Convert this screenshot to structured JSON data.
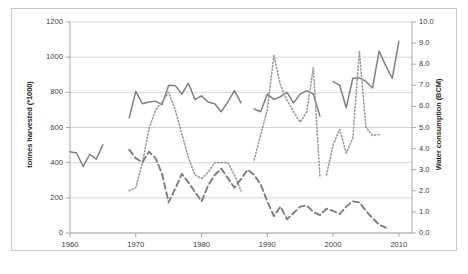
{
  "chart_data": {
    "type": "line",
    "title": "",
    "xlabel": "",
    "ylabel": "tonnes harvested (*1000)",
    "y2label": "Water consumption (BCM)",
    "xlim": [
      1960,
      2012
    ],
    "ylim": [
      0,
      1200
    ],
    "y2lim": [
      0.0,
      10.0
    ],
    "grid": true,
    "legend": "none",
    "x_ticks": [
      "1960",
      "1970",
      "1980",
      "1990",
      "2000",
      "2010"
    ],
    "x_tick_values": [
      1960,
      1970,
      1980,
      1990,
      2000,
      2010
    ],
    "y_ticks": [
      "0",
      "200",
      "400",
      "600",
      "800",
      "1000",
      "1200"
    ],
    "y_tick_values": [
      0,
      200,
      400,
      600,
      800,
      1000,
      1200
    ],
    "y2_ticks": [
      "0.0",
      "1.0",
      "2.0",
      "3.0",
      "4.0",
      "5.0",
      "6.0",
      "7.0",
      "8.0",
      "9.0",
      "10.0"
    ],
    "y2_tick_values": [
      0.0,
      1.0,
      2.0,
      3.0,
      4.0,
      5.0,
      6.0,
      7.0,
      8.0,
      9.0,
      10.0
    ],
    "series": [
      {
        "name": "tonnes harvested",
        "axis": "left",
        "style": "solid",
        "color": "#808080",
        "segments": [
          {
            "x": [
              1960,
              1961,
              1962,
              1963,
              1964,
              1965
            ],
            "y": [
              462,
              455,
              378,
              448,
              420,
              502
            ]
          },
          {
            "x": [
              1969,
              1970,
              1971,
              1972,
              1973,
              1974,
              1975,
              1976,
              1977,
              1978,
              1979,
              1980,
              1981,
              1982,
              1983,
              1984,
              1985,
              1986
            ],
            "y": [
              655,
              805,
              735,
              745,
              750,
              730,
              840,
              838,
              790,
              852,
              760,
              780,
              745,
              735,
              690,
              745,
              810,
              740
            ]
          },
          {
            "x": [
              1988,
              1989,
              1990,
              1991,
              1992,
              1993,
              1994,
              1995,
              1996,
              1997,
              1998
            ],
            "y": [
              705,
              690,
              790,
              760,
              775,
              800,
              740,
              790,
              810,
              790,
              665
            ]
          },
          {
            "x": [
              2000,
              2001,
              2002,
              2003,
              2004,
              2005,
              2006,
              2007,
              2008,
              2009,
              2010
            ],
            "y": [
              862,
              840,
              712,
              880,
              882,
              862,
              825,
              1035,
              952,
              880,
              1090
            ]
          }
        ]
      },
      {
        "name": "dotted series",
        "axis": "left",
        "style": "dotted",
        "color": "#9a9a9a",
        "segments": [
          {
            "x": [
              1969,
              1970,
              1971,
              1972,
              1973,
              1974,
              1975,
              1976,
              1977,
              1978,
              1979,
              1980,
              1981,
              1982,
              1983,
              1984,
              1985,
              1986
            ],
            "y": [
              240,
              258,
              398,
              590,
              700,
              745,
              800,
              700,
              565,
              430,
              330,
              310,
              345,
              400,
              400,
              400,
              330,
              240
            ]
          },
          {
            "x": [
              1988,
              1989,
              1990,
              1991,
              1992,
              1993,
              1994,
              1995,
              1996,
              1997,
              1998
            ],
            "y": [
              415,
              560,
              700,
              1010,
              840,
              755,
              690,
              630,
              690,
              940,
              320
            ]
          },
          {
            "x": [
              1999,
              2000,
              2001,
              2002,
              2003,
              2004,
              2005,
              2006,
              2007
            ],
            "y": [
              330,
              500,
              590,
              455,
              540,
              1035,
              600,
              555,
              560
            ]
          }
        ]
      },
      {
        "name": "water consumption",
        "axis": "right",
        "style": "dashed",
        "color": "#7d7d7d",
        "segments": [
          {
            "x": [
              1969,
              1970,
              1971,
              1972,
              1973,
              1974,
              1975,
              1976,
              1977,
              1978,
              1979,
              1980,
              1981,
              1982,
              1983,
              1984,
              1985,
              1986,
              1987,
              1988,
              1989,
              1990,
              1991,
              1992,
              1993,
              1994,
              1995,
              1996,
              1997,
              1998,
              1999,
              2000,
              2001,
              2002,
              2003,
              2004,
              2005,
              2006,
              2007,
              2008
            ],
            "y": [
              3.95,
              3.55,
              3.35,
              3.85,
              3.55,
              2.8,
              1.45,
              2.1,
              2.8,
              2.4,
              1.95,
              1.5,
              2.25,
              2.75,
              3.05,
              2.6,
              2.15,
              2.55,
              3.0,
              2.75,
              2.3,
              1.5,
              0.8,
              1.25,
              0.65,
              0.95,
              1.25,
              1.3,
              1.0,
              0.85,
              1.15,
              1.05,
              0.9,
              1.25,
              1.5,
              1.45,
              1.05,
              0.7,
              0.4,
              0.25
            ]
          }
        ]
      }
    ]
  },
  "axes": {
    "left_title": "tonnes harvested (*1000)",
    "right_title": "Water consumption (BCM)"
  }
}
